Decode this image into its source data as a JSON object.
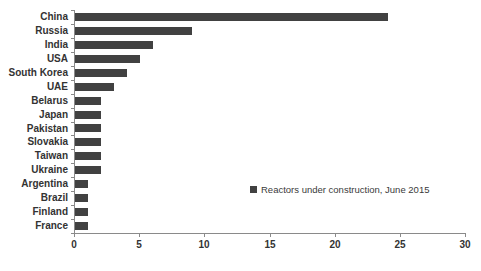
{
  "chart_data": {
    "type": "bar",
    "orientation": "horizontal",
    "title": "",
    "xlabel": "",
    "ylabel": "",
    "legend": "Reactors under construction, June 2015",
    "legend_position": "inside-right",
    "grid": false,
    "categories": [
      "China",
      "Russia",
      "India",
      "USA",
      "South Korea",
      "UAE",
      "Belarus",
      "Japan",
      "Pakistan",
      "Slovakia",
      "Taiwan",
      "Ukraine",
      "Argentina",
      "Brazil",
      "Finland",
      "France"
    ],
    "values": [
      24,
      9,
      6,
      5,
      4,
      3,
      2,
      2,
      2,
      2,
      2,
      2,
      1,
      1,
      1,
      1
    ],
    "xlim": [
      0,
      30
    ],
    "x_ticks": [
      0,
      5,
      10,
      15,
      20,
      25,
      30
    ],
    "colors": {
      "bar": "#414141",
      "axis": "#8a8a8a",
      "label": "#333333",
      "legend_text": "#3a3a3a",
      "background": "#ffffff"
    }
  }
}
